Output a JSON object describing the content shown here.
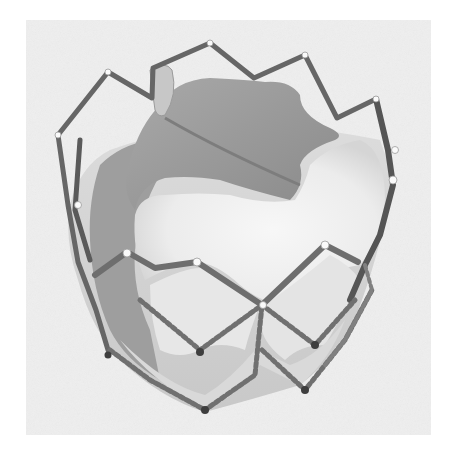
{
  "image": {
    "subject": "Transcatheter heart valve prosthesis",
    "description": "Grayscale product photograph of a transcatheter aortic heart valve: a metal stent frame with crown-shaped upper struts and diamond-patterned lower cells, holding pale tissue leaflets, shown on a light gray square background.",
    "style": "grayscale photograph",
    "text_visible": false
  },
  "colors": {
    "page_background": "#ffffff",
    "photo_background": "#efefef",
    "stent_strut": "#6a6a6a",
    "stent_strut_dark": "#4a4a4a",
    "leaflet_light": "#f3f3f3",
    "leaflet_mid": "#d8d8d8",
    "leaflet_shadow": "#9a9a9a",
    "leaflet_dark": "#8c8c8c",
    "node_highlight": "#fafafa"
  },
  "geometry": {
    "photo_box": {
      "x": 26,
      "y": 20,
      "width": 405,
      "height": 415
    },
    "crown_top_peak": {
      "x": 210,
      "y": 43
    },
    "bottom_tip": {
      "x": 205,
      "y": 412
    }
  }
}
